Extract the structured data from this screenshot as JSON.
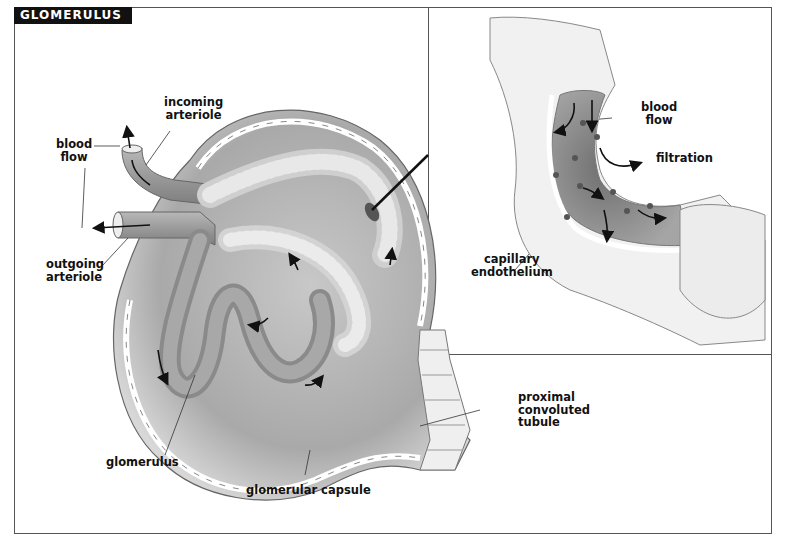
{
  "title": "GLOMERULUS",
  "main_labels": {
    "incoming_arteriole": "incoming\narteriole",
    "blood_flow": "blood\nflow",
    "outgoing_arteriole": "outgoing\narteriole",
    "glomerulus": "glomerulus",
    "glomerular_capsule": "glomerular capsule",
    "proximal_tubule": "proximal\nconvoluted\ntubule"
  },
  "inset_labels": {
    "blood_flow": "blood\nflow",
    "filtration": "filtration",
    "capillary_endothelium": "capillary\nendothelium"
  },
  "colors": {
    "title_bg": "#111111",
    "title_fg": "#ffffff",
    "frame": "#555555",
    "tissue_dark": "#8a8a8a",
    "tissue_mid": "#b5b5b5",
    "tissue_light": "#e2e2e2"
  }
}
